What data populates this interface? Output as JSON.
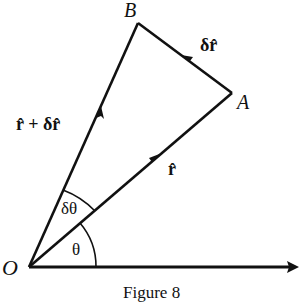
{
  "figure": {
    "caption": "Figure 8",
    "points": {
      "O": {
        "label": "O",
        "x": 29,
        "y": 267
      },
      "A": {
        "label": "A",
        "x": 232,
        "y": 93
      },
      "B": {
        "label": "B",
        "x": 138,
        "y": 23
      }
    },
    "vectors": {
      "r_hat": {
        "label": "r̂",
        "from": "O",
        "to": "A"
      },
      "delta_r_hat": {
        "label": "δr̂",
        "from": "A",
        "to": "B"
      },
      "r_hat_plus_delta": {
        "label": "r̂ + δr̂",
        "from": "O",
        "to": "B"
      }
    },
    "angles": {
      "theta": {
        "label": "θ"
      },
      "delta_theta": {
        "label": "δθ"
      }
    },
    "axis": {
      "from_x": 29,
      "to_x": 298,
      "y": 267
    },
    "colors": {
      "ink": "#111111",
      "background": "#ffffff"
    }
  }
}
